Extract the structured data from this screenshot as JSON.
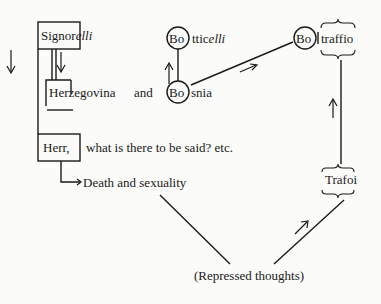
{
  "diagram": {
    "nodes": {
      "signorelli": {
        "prefix": "Signor",
        "suffix": "elli"
      },
      "herzegovina": {
        "prefix": "Her",
        "rest": "zegovina",
        "and": "and"
      },
      "bosnia": {
        "circled": "Bo",
        "rest": "snia"
      },
      "botticelli": {
        "circled": "Bo",
        "rest": "ttic",
        "italic": "elli"
      },
      "boltraffio": {
        "circled": "Bo",
        "rest": "traffio"
      },
      "herr": {
        "boxed": "Herr,",
        "rest": "what is there to be said? etc."
      },
      "death": {
        "label": "Death and sexuality"
      },
      "trafoi": {
        "label": "Trafoi"
      },
      "repressed": {
        "label": "(Repressed thoughts)"
      }
    },
    "edges": [
      {
        "from": "signorelli",
        "to": "herr",
        "type": "bracket-line"
      },
      {
        "from": "signorelli",
        "to": "herzegovina",
        "type": "double-line"
      },
      {
        "from": "herr",
        "to": "death",
        "type": "elbow-arrow"
      },
      {
        "from": "bosnia",
        "to": "botticelli",
        "type": "vertical-line"
      },
      {
        "from": "bosnia",
        "to": "boltraffio",
        "type": "diagonal-line"
      },
      {
        "from": "boltraffio",
        "to": "trafoi",
        "type": "vertical-line"
      },
      {
        "from": "death",
        "to": "repressed",
        "type": "diagonal-line"
      },
      {
        "from": "repressed",
        "to": "trafoi",
        "type": "diagonal-line"
      }
    ],
    "arrows": [
      "down-left",
      "down-inner",
      "up-botticelli",
      "right-diagonal",
      "up-trafoi",
      "up-right-repressed"
    ]
  }
}
